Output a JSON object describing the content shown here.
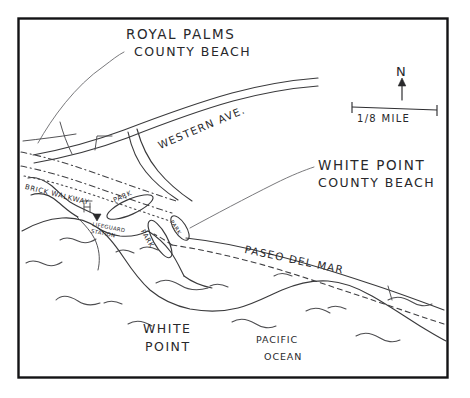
{
  "map": {
    "title": "White Point / Royal Palms County Beach area map",
    "style": "hand-drawn pen sketch",
    "colors": {
      "ink": "#3a3a3c",
      "frame": "#131315",
      "background": "#ffffff",
      "text": "#28282b"
    },
    "frame": {
      "x": 18,
      "y": 18,
      "width": 430,
      "height": 360
    },
    "labels": {
      "royal_palms": "ROYAL PALMS",
      "county_beach_rp": "COUNTY BEACH",
      "white_point_cb": "WHITE POINT",
      "county_beach_wp": "COUNTY BEACH",
      "western_ave": "WESTERN AVE.",
      "paseo_del_mar": "PASEO DEL MAR",
      "brick_walkway": "BRICK WALKWAY",
      "lifeguard_station": "LIFEGUARD\nSTATION",
      "white_point": "WHITE",
      "white_point_2": "POINT",
      "pacific": "PACIFIC",
      "ocean": "OCEAN",
      "parking_1": "PARK",
      "parking_2": "PARK",
      "parking_3": "PARK"
    },
    "compass": {
      "north_label": "N",
      "direction": "up"
    },
    "scale_bar": {
      "label": "1/8 MILE",
      "numerator": "1",
      "denominator": "8",
      "unit": "MILE"
    },
    "features": [
      {
        "name": "western-ave-road",
        "type": "road",
        "style": "solid"
      },
      {
        "name": "paseo-del-mar-road",
        "type": "road",
        "style": "solid"
      },
      {
        "name": "brick-walkway",
        "type": "path",
        "style": "dash-dot"
      },
      {
        "name": "coastal-trail",
        "type": "path",
        "style": "dashed"
      },
      {
        "name": "coastline",
        "type": "shoreline",
        "style": "solid"
      },
      {
        "name": "pacific-ocean",
        "type": "water",
        "style": "wave-squiggles"
      },
      {
        "name": "parking-lot-1",
        "type": "parking",
        "style": "oval"
      },
      {
        "name": "parking-lot-2",
        "type": "parking",
        "style": "oval"
      },
      {
        "name": "parking-lot-3",
        "type": "parking",
        "style": "oval"
      },
      {
        "name": "lifeguard-station-marker",
        "type": "point-of-interest",
        "style": "triangle-marker"
      }
    ]
  }
}
